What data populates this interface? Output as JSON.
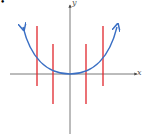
{
  "diagram": {
    "axes": {
      "x_label": "x",
      "y_label": "y"
    },
    "curve": {
      "type": "parabola",
      "equation_shape": "y = x^2",
      "color": "#3a6fc4"
    },
    "test_lines": {
      "count": 4,
      "color": "#e0262c"
    },
    "bullet": "•"
  }
}
